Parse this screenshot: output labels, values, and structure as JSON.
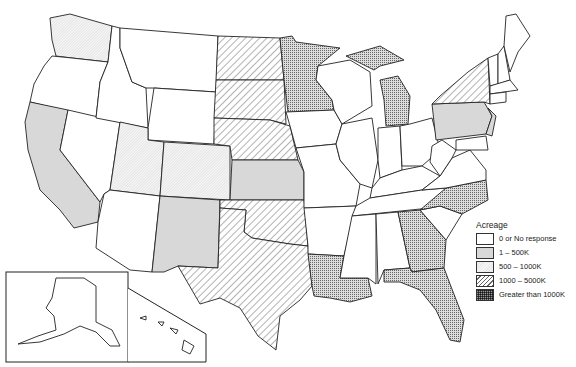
{
  "map": {
    "type": "choropleth",
    "region": "United States",
    "legend": {
      "title": "Acreage",
      "items": [
        {
          "key": "none",
          "label": "0 or No response",
          "fill": "#ffffff"
        },
        {
          "key": "gray",
          "label": "1 – 500K",
          "fill": "#d8d8d8"
        },
        {
          "key": "light",
          "label": "500 – 1000K",
          "fill": "#eeeeee"
        },
        {
          "key": "hatch",
          "label": "1000 – 5000K",
          "fill": "hatched"
        },
        {
          "key": "cross",
          "label": "Greater than 1000K",
          "fill": "crosshatched"
        }
      ]
    },
    "states": {
      "WA": "light",
      "OR": "none",
      "CA": "gray",
      "NV": "none",
      "ID": "none",
      "MT": "none",
      "WY": "none",
      "UT": "light",
      "CO": "light",
      "AZ": "none",
      "NM": "gray",
      "ND": "hatch",
      "SD": "hatch",
      "NE": "hatch",
      "KS": "gray",
      "OK": "hatch",
      "TX": "hatch",
      "MN": "cross",
      "IA": "none",
      "MO": "none",
      "AR": "none",
      "LA": "cross",
      "WI": "none",
      "IL": "none",
      "MI": "cross",
      "IN": "none",
      "OH": "none",
      "KY": "none",
      "TN": "none",
      "MS": "none",
      "AL": "none",
      "GA": "cross",
      "FL": "cross",
      "SC": "none",
      "NC": "cross",
      "VA": "none",
      "WV": "none",
      "PA": "gray",
      "NY": "hatch",
      "VT": "none",
      "NH": "none",
      "ME": "none",
      "MA": "none",
      "CT": "none",
      "RI": "none",
      "NJ": "gray",
      "DE": "none",
      "MD": "none",
      "AK": "none",
      "HI": "none"
    }
  }
}
